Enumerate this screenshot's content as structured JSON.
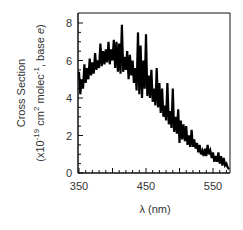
{
  "chart_data": {
    "type": "line",
    "title": "",
    "xlabel": "λ (nm)",
    "ylabel_line1": "Cross Section",
    "ylabel_line2": "(x10^-19 cm^2 molec^-1, base e)",
    "xlim": [
      350,
      575
    ],
    "ylim": [
      0,
      8.5
    ],
    "xticks": [
      350,
      450,
      550
    ],
    "xtick_labels": [
      "350",
      "450",
      "550"
    ],
    "yticks": [
      0,
      2,
      4,
      6,
      8
    ],
    "ytick_labels": [
      "0",
      "2",
      "4",
      "6",
      "8"
    ],
    "grid": false,
    "legend": null,
    "series": [
      {
        "name": "absorption cross section",
        "x": [
          350,
          352,
          354,
          356,
          358,
          360,
          362,
          364,
          366,
          368,
          370,
          372,
          374,
          376,
          378,
          380,
          382,
          384,
          386,
          388,
          390,
          392,
          394,
          396,
          398,
          400,
          402,
          404,
          406,
          408,
          410,
          412,
          414,
          416,
          418,
          420,
          422,
          424,
          426,
          428,
          430,
          432,
          434,
          436,
          438,
          440,
          442,
          444,
          446,
          448,
          450,
          452,
          454,
          456,
          458,
          460,
          462,
          464,
          466,
          468,
          470,
          472,
          474,
          476,
          478,
          480,
          482,
          484,
          486,
          488,
          490,
          492,
          494,
          496,
          498,
          500,
          502,
          504,
          506,
          508,
          510,
          512,
          514,
          516,
          518,
          520,
          522,
          524,
          526,
          528,
          530,
          532,
          534,
          536,
          538,
          540,
          542,
          544,
          546,
          548,
          550,
          552,
          554,
          556,
          558,
          560,
          562,
          564,
          566,
          568,
          570,
          572,
          574
        ],
        "values": [
          5.4,
          4.2,
          5.0,
          4.5,
          5.8,
          4.8,
          5.6,
          5.0,
          6.1,
          5.2,
          5.9,
          5.3,
          6.4,
          5.5,
          6.0,
          5.6,
          6.9,
          5.7,
          6.5,
          5.8,
          6.6,
          5.9,
          7.0,
          5.8,
          6.6,
          6.0,
          7.1,
          5.6,
          7.0,
          5.4,
          6.9,
          5.3,
          7.9,
          5.4,
          6.2,
          5.5,
          6.5,
          5.0,
          6.3,
          5.2,
          6.0,
          4.8,
          5.6,
          4.4,
          7.5,
          4.2,
          6.8,
          4.0,
          6.0,
          4.5,
          7.4,
          4.1,
          5.2,
          4.0,
          5.5,
          3.8,
          4.5,
          3.6,
          5.6,
          3.5,
          4.8,
          3.2,
          4.5,
          3.0,
          3.6,
          2.8,
          4.8,
          2.6,
          3.3,
          2.4,
          4.5,
          2.2,
          3.0,
          2.1,
          3.4,
          1.6,
          2.8,
          1.8,
          2.6,
          1.7,
          2.5,
          1.5,
          2.0,
          1.4,
          2.3,
          1.4,
          1.8,
          1.3,
          1.6,
          1.1,
          1.5,
          1.0,
          1.2,
          0.9,
          1.3,
          0.9,
          1.5,
          1.0,
          1.2,
          0.8,
          1.1,
          0.6,
          0.9,
          0.6,
          1.1,
          0.5,
          0.9,
          0.4,
          0.8,
          0.4,
          0.5,
          0.3,
          0.2
        ]
      }
    ]
  }
}
